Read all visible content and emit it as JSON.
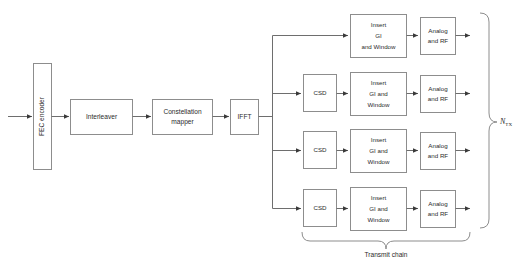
{
  "diagram": {
    "colors": {
      "background": "#ffffff",
      "block_stroke": "#8d8d8d",
      "wire": "#6e6e6e",
      "text": "#2b2b2b"
    },
    "blocks": {
      "fec_encoder": {
        "label": "FEC encoder",
        "orientation": "vertical"
      },
      "interleaver": {
        "label": "Interleaver"
      },
      "constellation_mapper": {
        "label_line1": "Constellation",
        "label_line2": "mapper"
      },
      "ifft": {
        "label": "IFFT"
      },
      "csd": {
        "label": "CSD"
      },
      "insert_gi_row1": {
        "line1": "Insert",
        "line2": "GI",
        "line3": "and Window"
      },
      "insert_gi_rows": {
        "line1": "Insert",
        "line2": "GI and",
        "line3": "Window"
      },
      "analog_rf": {
        "line1": "Analog",
        "line2": "and RF"
      }
    },
    "branches": [
      {
        "index": 1,
        "has_csd": false,
        "csd_label": "",
        "gi_line1": "Insert",
        "gi_line2": "GI",
        "gi_line3": "and Window",
        "rf_line1": "Analog",
        "rf_line2": "and RF"
      },
      {
        "index": 2,
        "has_csd": true,
        "csd_label": "CSD",
        "gi_line1": "Insert",
        "gi_line2": "GI and",
        "gi_line3": "Window",
        "rf_line1": "Analog",
        "rf_line2": "and RF"
      },
      {
        "index": 3,
        "has_csd": true,
        "csd_label": "CSD",
        "gi_line1": "Insert",
        "gi_line2": "GI and",
        "gi_line3": "Window",
        "rf_line1": "Analog",
        "rf_line2": "and RF"
      },
      {
        "index": 4,
        "has_csd": true,
        "csd_label": "CSD",
        "gi_line1": "Insert",
        "gi_line2": "GI and",
        "gi_line3": "Window",
        "rf_line1": "Analog",
        "rf_line2": "and RF"
      }
    ],
    "annotations": {
      "transmit_chain": "Transmit chain",
      "ntx_symbol": "N",
      "ntx_subscript": "TX"
    }
  }
}
